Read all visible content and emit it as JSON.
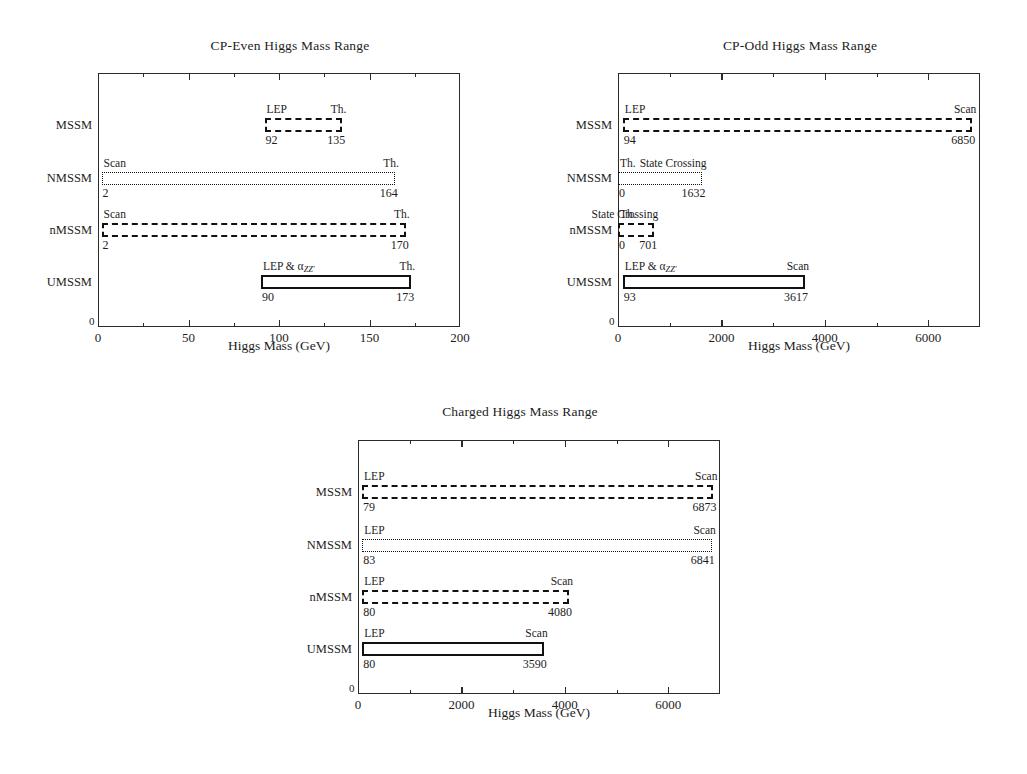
{
  "figure": {
    "axis_label": "Higgs Mass (GeV)",
    "origin_label": "0"
  },
  "chart_data": [
    {
      "id": "cp-even",
      "type": "bar",
      "orientation": "horizontal",
      "title": "CP-Even Higgs Mass Range",
      "xlabel": "Higgs Mass (GeV)",
      "ylabel": "",
      "xlim": [
        0,
        200
      ],
      "xticks": [
        0,
        50,
        100,
        150,
        200
      ],
      "xticklabels": [
        "0",
        "50",
        "100",
        "150",
        "200"
      ],
      "minor_tick_step": 25,
      "grid": false,
      "legend": "none",
      "categories": [
        "MSSM",
        "NMSSM",
        "nMSSM",
        "UMSSM"
      ],
      "ranges": [
        {
          "model": "MSSM",
          "low": 92,
          "high": 135,
          "low_label": "92",
          "high_label": "135",
          "left_note": "LEP",
          "right_note": "Th.",
          "style": "dashdot"
        },
        {
          "model": "NMSSM",
          "low": 2,
          "high": 164,
          "low_label": "2",
          "high_label": "164",
          "left_note": "Scan",
          "right_note": "Th.",
          "style": "dotted"
        },
        {
          "model": "nMSSM",
          "low": 2,
          "high": 170,
          "low_label": "2",
          "high_label": "170",
          "left_note": "Scan",
          "right_note": "Th.",
          "style": "dashed"
        },
        {
          "model": "UMSSM",
          "low": 90,
          "high": 173,
          "low_label": "90",
          "high_label": "173",
          "left_note": "LEP & αZZ'",
          "right_note": "Th.",
          "style": "solid"
        }
      ]
    },
    {
      "id": "cp-odd",
      "type": "bar",
      "orientation": "horizontal",
      "title": "CP-Odd Higgs Mass Range",
      "xlabel": "Higgs Mass (GeV)",
      "ylabel": "",
      "xlim": [
        0,
        7000
      ],
      "xticks": [
        0,
        2000,
        4000,
        6000
      ],
      "xticklabels": [
        "0",
        "2000",
        "4000",
        "6000"
      ],
      "minor_tick_step": 1000,
      "grid": false,
      "legend": "none",
      "categories": [
        "MSSM",
        "NMSSM",
        "nMSSM",
        "UMSSM"
      ],
      "ranges": [
        {
          "model": "MSSM",
          "low": 94,
          "high": 6850,
          "low_label": "94",
          "high_label": "6850",
          "left_note": "LEP",
          "right_note": "Scan",
          "style": "dashdot"
        },
        {
          "model": "NMSSM",
          "low": 0,
          "high": 1632,
          "low_label": "0",
          "high_label": "1632",
          "left_note": "Th.",
          "right_note": "State Crossing",
          "style": "dotted"
        },
        {
          "model": "nMSSM",
          "low": 0,
          "high": 701,
          "low_label": "0",
          "high_label": "701",
          "left_note": "Th.",
          "right_note": "State Crossing",
          "style": "dashed"
        },
        {
          "model": "UMSSM",
          "low": 93,
          "high": 3617,
          "low_label": "93",
          "high_label": "3617",
          "left_note": "LEP & αZZ'",
          "right_note": "Scan",
          "style": "solid"
        }
      ]
    },
    {
      "id": "charged",
      "type": "bar",
      "orientation": "horizontal",
      "title": "Charged Higgs Mass Range",
      "xlabel": "Higgs Mass (GeV)",
      "ylabel": "",
      "xlim": [
        0,
        7000
      ],
      "xticks": [
        0,
        2000,
        4000,
        6000
      ],
      "xticklabels": [
        "0",
        "2000",
        "4000",
        "6000"
      ],
      "minor_tick_step": 1000,
      "grid": false,
      "legend": "none",
      "categories": [
        "MSSM",
        "NMSSM",
        "nMSSM",
        "UMSSM"
      ],
      "ranges": [
        {
          "model": "MSSM",
          "low": 79,
          "high": 6873,
          "low_label": "79",
          "high_label": "6873",
          "left_note": "LEP",
          "right_note": "Scan",
          "style": "dashdot"
        },
        {
          "model": "NMSSM",
          "low": 83,
          "high": 6841,
          "low_label": "83",
          "high_label": "6841",
          "left_note": "LEP",
          "right_note": "Scan",
          "style": "dotted"
        },
        {
          "model": "nMSSM",
          "low": 80,
          "high": 4080,
          "low_label": "80",
          "high_label": "4080",
          "left_note": "LEP",
          "right_note": "Scan",
          "style": "dashed"
        },
        {
          "model": "UMSSM",
          "low": 80,
          "high": 3590,
          "low_label": "80",
          "high_label": "3590",
          "left_note": "LEP",
          "right_note": "Scan",
          "style": "solid"
        }
      ]
    }
  ]
}
